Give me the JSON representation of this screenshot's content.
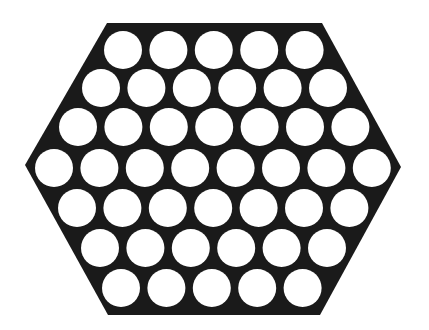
{
  "figure": {
    "background_color": "#ffffff",
    "plate_color": "#1a1a1a",
    "hole_color": "#ffffff",
    "hexagon_points": [
      [
        107,
        23
      ],
      [
        322,
        23
      ],
      [
        401,
        167
      ],
      [
        320,
        315
      ],
      [
        108,
        315
      ],
      [
        25,
        165
      ]
    ],
    "hole_radius": 19,
    "hole_spacing": 45.4,
    "rows": [
      {
        "y": 50,
        "first_x": 123,
        "count": 5
      },
      {
        "y": 88,
        "first_x": 101,
        "count": 6
      },
      {
        "y": 127,
        "first_x": 78,
        "count": 7
      },
      {
        "y": 168,
        "first_x": 54,
        "count": 8
      },
      {
        "y": 208,
        "first_x": 77,
        "count": 7
      },
      {
        "y": 248,
        "first_x": 100,
        "count": 6
      },
      {
        "y": 288,
        "first_x": 121,
        "count": 5
      }
    ],
    "total_holes": 44
  }
}
